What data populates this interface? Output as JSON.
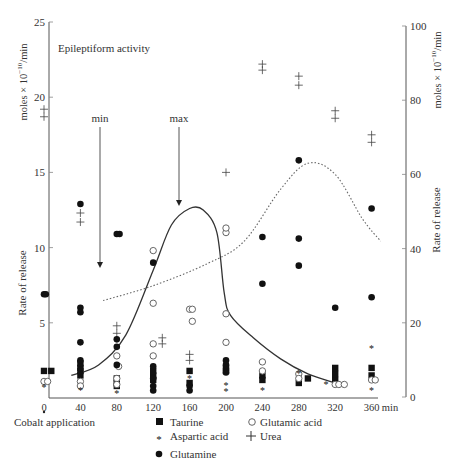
{
  "chart_data": {
    "type": "scatter",
    "title": "Epileptiform activity",
    "xlabel": "min",
    "ylabel_left": "Rate of release",
    "ylabel_left_units": "moles × 10^-10/min",
    "ylabel_right": "Rate of release",
    "ylabel_right_units": "moles × 10^-10/min",
    "x_ticks": [
      0,
      40,
      80,
      120,
      160,
      200,
      240,
      280,
      320,
      360
    ],
    "y_left_ticks": [
      5,
      10,
      15,
      20,
      25
    ],
    "y_right_ticks": [
      0,
      20,
      40,
      60,
      80,
      100
    ],
    "xlim": [
      0,
      370
    ],
    "ylim_left": [
      0,
      25
    ],
    "ylim_right": [
      0,
      100
    ],
    "grid": false,
    "annotations": [
      {
        "text": "min",
        "x": 60,
        "arrow_to_y": 9
      },
      {
        "text": "max",
        "x": 150,
        "arrow_to_y": 13
      },
      {
        "text": "Cobalt application",
        "x": 0
      }
    ],
    "legend": [
      {
        "label": "Taurine",
        "marker": "filled-square"
      },
      {
        "label": "Glutamic acid",
        "marker": "open-circle"
      },
      {
        "label": "Aspartic acid",
        "marker": "asterisk"
      },
      {
        "label": "Urea",
        "marker": "plus"
      },
      {
        "label": "Glutamine",
        "marker": "filled-circle"
      }
    ],
    "curves": [
      {
        "name": "Epileptiform activity (solid)",
        "axis": "left",
        "x": [
          30,
          60,
          90,
          120,
          140,
          160,
          175,
          190,
          198,
          205,
          230,
          260,
          290,
          320
        ],
        "y": [
          1.5,
          2.2,
          4.2,
          8.5,
          11.5,
          12.6,
          12.5,
          11.0,
          7.0,
          5.5,
          4.0,
          2.6,
          1.6,
          1.0
        ]
      },
      {
        "name": "Urea trend (dotted)",
        "axis": "right",
        "x": [
          65,
          120,
          180,
          220,
          260,
          290,
          320,
          350,
          370
        ],
        "y": [
          26,
          30,
          36,
          42,
          56,
          63,
          60,
          48,
          42
        ]
      }
    ],
    "series": [
      {
        "name": "Taurine",
        "axis": "left",
        "points": [
          [
            0,
            1.8
          ],
          [
            8,
            1.8
          ],
          [
            40,
            1.5
          ],
          [
            40,
            1.8
          ],
          [
            40,
            2.0
          ],
          [
            40,
            2.3
          ],
          [
            80,
            1.0
          ],
          [
            80,
            1.3
          ],
          [
            80,
            0.8
          ],
          [
            120,
            1.2
          ],
          [
            120,
            1.5
          ],
          [
            120,
            1.8
          ],
          [
            160,
            1.0
          ],
          [
            160,
            1.8
          ],
          [
            200,
            2.0
          ],
          [
            200,
            1.8
          ],
          [
            240,
            1.5
          ],
          [
            240,
            1.2
          ],
          [
            280,
            1.0
          ],
          [
            290,
            1.3
          ],
          [
            320,
            1.2
          ],
          [
            320,
            1.6
          ],
          [
            320,
            2.0
          ],
          [
            360,
            1.5
          ],
          [
            360,
            2.0
          ]
        ]
      },
      {
        "name": "Glutamic acid",
        "axis": "left",
        "points": [
          [
            0,
            1.1
          ],
          [
            4,
            1.1
          ],
          [
            40,
            1.1
          ],
          [
            40,
            0.8
          ],
          [
            80,
            2.8
          ],
          [
            80,
            1.3
          ],
          [
            80,
            0.9
          ],
          [
            82,
            2.1
          ],
          [
            120,
            3.6
          ],
          [
            120,
            2.8
          ],
          [
            120,
            6.3
          ],
          [
            120,
            9.8
          ],
          [
            160,
            5.9
          ],
          [
            163,
            5.9
          ],
          [
            163,
            5.1
          ],
          [
            200,
            5.6
          ],
          [
            200,
            3.7
          ],
          [
            200,
            11.0
          ],
          [
            200,
            11.3
          ],
          [
            240,
            2.4
          ],
          [
            240,
            1.8
          ],
          [
            280,
            1.6
          ],
          [
            280,
            1.3
          ],
          [
            320,
            0.9
          ],
          [
            324,
            0.9
          ],
          [
            330,
            0.9
          ],
          [
            360,
            1.2
          ],
          [
            364,
            1.2
          ]
        ]
      },
      {
        "name": "Aspartic acid",
        "axis": "left",
        "points": [
          [
            0,
            0.7
          ],
          [
            40,
            0.5
          ],
          [
            80,
            0.3
          ],
          [
            120,
            0.5
          ],
          [
            160,
            1.3
          ],
          [
            200,
            0.8
          ],
          [
            200,
            0.4
          ],
          [
            240,
            0.5
          ],
          [
            280,
            1.6
          ],
          [
            310,
            0.9
          ],
          [
            360,
            3.3
          ],
          [
            360,
            0.5
          ]
        ]
      },
      {
        "name": "Urea",
        "axis": "left",
        "points": [
          [
            0,
            19.2
          ],
          [
            0,
            18.7
          ],
          [
            40,
            12.3
          ],
          [
            40,
            11.7
          ],
          [
            80,
            4.8
          ],
          [
            80,
            4.3
          ],
          [
            130,
            3.6
          ],
          [
            130,
            4.0
          ],
          [
            160,
            2.5
          ],
          [
            160,
            2.9
          ],
          [
            200,
            15.0
          ],
          [
            240,
            22.2
          ],
          [
            240,
            21.8
          ],
          [
            280,
            21.4
          ],
          [
            280,
            20.8
          ],
          [
            320,
            19.1
          ],
          [
            320,
            18.6
          ],
          [
            360,
            17.5
          ],
          [
            360,
            17.0
          ]
        ]
      },
      {
        "name": "Glutamine",
        "axis": "left",
        "points": [
          [
            0,
            6.9
          ],
          [
            2,
            6.9
          ],
          [
            40,
            12.9
          ],
          [
            40,
            6.0
          ],
          [
            40,
            5.7
          ],
          [
            40,
            3.7
          ],
          [
            40,
            2.5
          ],
          [
            80,
            10.9
          ],
          [
            83,
            10.9
          ],
          [
            80,
            3.9
          ],
          [
            80,
            3.4
          ],
          [
            80,
            2.2
          ],
          [
            120,
            9.0
          ],
          [
            120,
            2.1
          ],
          [
            120,
            1.3
          ],
          [
            120,
            0.8
          ],
          [
            120,
            0.5
          ],
          [
            160,
            0.8
          ],
          [
            160,
            0.5
          ],
          [
            200,
            2.5
          ],
          [
            200,
            2.2
          ],
          [
            200,
            1.7
          ],
          [
            240,
            10.7
          ],
          [
            240,
            7.6
          ],
          [
            280,
            15.8
          ],
          [
            280,
            10.6
          ],
          [
            280,
            8.8
          ],
          [
            320,
            6.0
          ],
          [
            360,
            12.6
          ],
          [
            360,
            6.7
          ]
        ]
      }
    ]
  },
  "labels": {
    "title": "Epileptiform activity",
    "left_units": "moles × 10",
    "left_units_exp": "−10",
    "left_units_tail": "/min",
    "right_units": "moles × 10",
    "right_units_exp": "−10",
    "right_units_tail": "/min",
    "left_axis_label": "Rate of release",
    "right_axis_label": "Rate of release",
    "x_unit": "min",
    "min_label": "min",
    "max_label": "max",
    "cobalt": "Cobalt application",
    "legend_taurine": "Taurine",
    "legend_glutamic": "Glutamic acid",
    "legend_aspartic": "Aspartic acid",
    "legend_urea": "Urea",
    "legend_glutamine": "Glutamine"
  }
}
